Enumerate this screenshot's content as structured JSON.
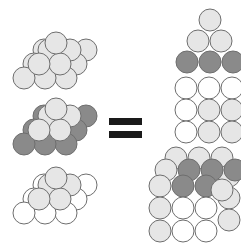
{
  "diagram": {
    "colors": {
      "light": "#e6e6e6",
      "white": "#ffffff",
      "dark": "#8a8a8a",
      "stroke": "#6e6e6e",
      "equals": "#1a1a1a"
    },
    "symbol": "=",
    "radius": 11
  }
}
